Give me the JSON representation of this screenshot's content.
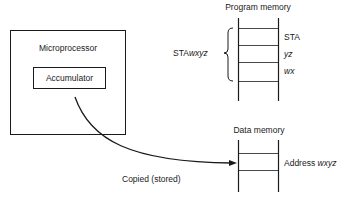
{
  "diagram": {
    "microprocessor": {
      "label": "Microprocessor",
      "accumulator_label": "Accumulator"
    },
    "program_memory": {
      "title": "Program memory",
      "instruction_label_prefix": "STA",
      "instruction_label_operand": "wxyz",
      "cells": [
        {
          "text": "STA",
          "italic": false
        },
        {
          "text": "yz",
          "italic": true
        },
        {
          "text": "wx",
          "italic": true
        }
      ]
    },
    "data_memory": {
      "title": "Data memory",
      "cell_label_prefix": "Address ",
      "cell_label_operand": "wxyz"
    },
    "arrow": {
      "label": "Copied (stored)"
    }
  }
}
